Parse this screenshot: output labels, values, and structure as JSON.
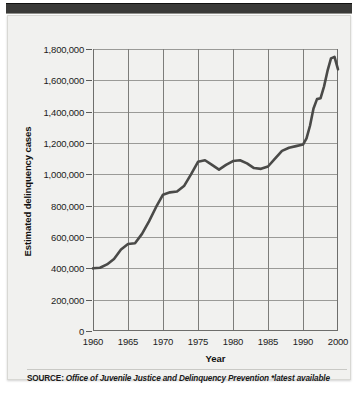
{
  "figure": {
    "y_axis_title": "Estimated delinquency cases",
    "x_axis_title": "Year",
    "source_label": "SOURCE:",
    "source_body": "Office of Juvenile Justice and Delinquency Prevention *latest available",
    "line_color": "#4a4a48",
    "panel_color": "#f1f1ef",
    "grid_color": "#9a9a97",
    "axis_color": "#6e6e6c"
  },
  "chart_data": {
    "type": "line",
    "title": "",
    "subtitle": "",
    "xlabel": "Year",
    "ylabel": "Estimated delinquency cases",
    "xlim": [
      1960,
      2000
    ],
    "ylim": [
      0,
      1800000
    ],
    "yticks": [
      0,
      200000,
      400000,
      600000,
      800000,
      1000000,
      1200000,
      1400000,
      1600000,
      1800000
    ],
    "ytick_labels": [
      "0",
      "200,000",
      "400,000",
      "600,000",
      "800,000",
      "1,000,000",
      "1,200,000",
      "1,400,000",
      "1,600,000",
      "1,800,000"
    ],
    "xticks": [
      1960,
      1965,
      1970,
      1975,
      1980,
      1985,
      1990,
      2000
    ],
    "xtick_labels": [
      "1960",
      "1965",
      "1970",
      "1975",
      "1980",
      "1985",
      "1990",
      "2000"
    ],
    "grid": true,
    "legend": "none",
    "series": [
      {
        "name": "Estimated delinquency cases",
        "color": "#4a4a48",
        "x": [
          1960,
          1961,
          1962,
          1963,
          1964,
          1965,
          1966,
          1967,
          1968,
          1969,
          1970,
          1971,
          1972,
          1973,
          1974,
          1975,
          1976,
          1977,
          1978,
          1979,
          1980,
          1981,
          1982,
          1983,
          1984,
          1985,
          1986,
          1987,
          1988,
          1989,
          1990,
          1991,
          1992,
          1993,
          1994,
          1995,
          1996,
          1997,
          1998,
          1999,
          2000
        ],
        "values": [
          400000,
          404000,
          425000,
          460000,
          520000,
          555000,
          560000,
          620000,
          700000,
          790000,
          870000,
          885000,
          890000,
          925000,
          1000000,
          1080000,
          1090000,
          1060000,
          1030000,
          1060000,
          1085000,
          1090000,
          1070000,
          1040000,
          1035000,
          1050000,
          1100000,
          1150000,
          1170000,
          1180000,
          1190000,
          1230000,
          1310000,
          1420000,
          1480000,
          1485000,
          1560000,
          1660000,
          1740000,
          1750000,
          1670000
        ]
      }
    ],
    "annotations": [
      "Series rises from about 400,000 cases in 1960 to a plateau near 1,050,000-1,090,000 across 1975-1985, then climbs to a peak of about 1,750,000 near 1997-1999 before declining to roughly 1,670,000 at the right edge."
    ]
  }
}
